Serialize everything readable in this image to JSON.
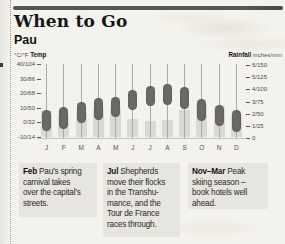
{
  "page": {
    "title": "When to Go",
    "subtitle": "Pau"
  },
  "axes": {
    "temp_unit": "°C/°F",
    "temp_word": "Temp",
    "rain_word": "Rainfall",
    "rain_unit": "inches/mm"
  },
  "chart_data": {
    "type": "bar",
    "subtype": "climate chart: monthly rainfall bars plus monthly temperature-range pill markers",
    "categories": [
      "J",
      "F",
      "M",
      "A",
      "M",
      "J",
      "J",
      "A",
      "S",
      "O",
      "N",
      "D"
    ],
    "series": [
      {
        "name": "Rainfall (mm)",
        "values": [
          55,
          47,
          51,
          60,
          61,
          40,
          35,
          36,
          57,
          70,
          63,
          47
        ]
      },
      {
        "name": "Temperature range min (°C)",
        "values": [
          -6,
          -5,
          -1,
          1.5,
          3.5,
          8,
          11,
          12,
          9,
          1,
          -3,
          -7
        ]
      },
      {
        "name": "Temperature range max (°C)",
        "values": [
          8.5,
          10.5,
          14,
          16.5,
          17.5,
          22,
          25,
          26,
          24,
          16,
          12,
          8
        ]
      }
    ],
    "left_axis": {
      "label": "°C/°F Temp",
      "ticks": [
        "40/104",
        "30/86",
        "20/68",
        "10/50",
        "0/32",
        "-10/14"
      ],
      "range_c": [
        -10,
        40
      ]
    },
    "right_axis": {
      "label": "Rainfall inches/mm",
      "ticks": [
        "6/150",
        "5/125",
        "4/100",
        "3/75",
        "2/50",
        "1/25",
        "0"
      ],
      "range_mm": [
        0,
        150
      ]
    },
    "grid": "one vertical gridline per month",
    "legend_position": "none"
  },
  "notes": [
    {
      "label": "Feb",
      "lines": [
        "Pau’s spring",
        "carnival takes",
        "over the capital’s",
        "streets."
      ]
    },
    {
      "label": "Jul",
      "lines": [
        "Shepherds",
        "move their flocks",
        "in the Transhu-",
        "mance, and the",
        "Tour de France",
        "races through."
      ]
    },
    {
      "label": "Nov–Mar",
      "lines": [
        "Peak",
        "skiing season –",
        "book hotels well",
        "ahead."
      ]
    }
  ],
  "colors": {
    "page_bg": "#f4f2ec",
    "note_bg": "#e7e5df",
    "rainfall_bar": "#d9d8d2",
    "temp_pill": "#696968",
    "top_rule": "#565656"
  }
}
